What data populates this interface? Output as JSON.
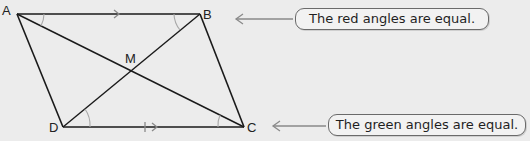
{
  "figure": {
    "type": "parallelogram-diagram",
    "background": "#ececec",
    "line_color": "#1a1a1a",
    "mark_color": "#8a8a8a",
    "vertices": {
      "A": {
        "label": "A",
        "x": 17,
        "y": 14
      },
      "B": {
        "label": "B",
        "x": 200,
        "y": 14
      },
      "C": {
        "label": "C",
        "x": 244,
        "y": 127
      },
      "D": {
        "label": "D",
        "x": 63,
        "y": 127
      },
      "M": {
        "label": "M",
        "x": 131,
        "y": 70
      }
    },
    "edges": [
      "AB",
      "BC",
      "CD",
      "DA"
    ],
    "diagonals": [
      "AC",
      "BD"
    ],
    "parallel_marks": [
      {
        "edge": "AB",
        "style": "single-arrow"
      },
      {
        "edge": "DC",
        "style": "tick-arrow"
      }
    ],
    "angle_groups": [
      {
        "color_name": "red",
        "color": "#b0b0b0",
        "angles": [
          "BAC",
          "ACD"
        ]
      },
      {
        "color_name": "green",
        "color": "#b0b0b0",
        "angles": [
          "ABD",
          "BDC"
        ]
      }
    ]
  },
  "callouts": [
    {
      "id": "red",
      "text": "The red angles are equal.",
      "points_to": "AB"
    },
    {
      "id": "green",
      "text": "The green angles are equal.",
      "points_to": "DC"
    }
  ]
}
